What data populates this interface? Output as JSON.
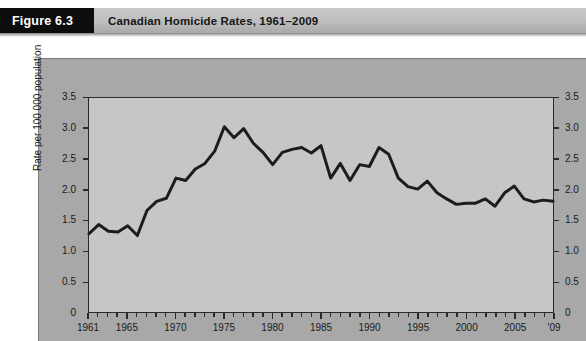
{
  "header": {
    "badge_label": "Figure 6.3",
    "title": "Canadian Homicide Rates, 1961–2009"
  },
  "colors": {
    "panel_background": "#a8a8a8",
    "plot_background": "#c6c6c6",
    "line_color": "#1c1c1c",
    "axis_color": "#2a2a2a",
    "badge_background": "#0d0d0d",
    "header_background": "#bdbdbd"
  },
  "chart_data": {
    "type": "line",
    "title": "Canadian Homicide Rates, 1961–2009",
    "xlabel": "",
    "ylabel": "Rate per 100 000 population",
    "ylabel_right": "Rate per 100 000 population",
    "xlim": [
      1961,
      2009
    ],
    "ylim": [
      0,
      3.5
    ],
    "grid": false,
    "legend": null,
    "y_ticks": [
      "0",
      "0.5",
      "1.0",
      "1.5",
      "2.0",
      "2.5",
      "3.0",
      "3.5"
    ],
    "y_tick_values": [
      0,
      0.5,
      1.0,
      1.5,
      2.0,
      2.5,
      3.0,
      3.5
    ],
    "y_ticks_right": [
      "0",
      "0.5",
      "1.0",
      "1.5",
      "2.0",
      "2.5",
      "3.0",
      "3.5"
    ],
    "x_ticks": [
      "1961",
      "1965",
      "1970",
      "1975",
      "1980",
      "1985",
      "1990",
      "1995",
      "2000",
      "2005",
      "'09"
    ],
    "x_tick_values": [
      1961,
      1965,
      1970,
      1975,
      1980,
      1985,
      1990,
      1995,
      2000,
      2005,
      2009
    ],
    "x_minor_tick_interval": 1,
    "series": [
      {
        "name": "Homicide rate",
        "x": [
          1961,
          1962,
          1963,
          1964,
          1965,
          1966,
          1967,
          1968,
          1969,
          1970,
          1971,
          1972,
          1973,
          1974,
          1975,
          1976,
          1977,
          1978,
          1979,
          1980,
          1981,
          1982,
          1983,
          1984,
          1985,
          1986,
          1987,
          1988,
          1989,
          1990,
          1991,
          1992,
          1993,
          1994,
          1995,
          1996,
          1997,
          1998,
          1999,
          2000,
          2001,
          2002,
          2003,
          2004,
          2005,
          2006,
          2007,
          2008,
          2009
        ],
        "values": [
          1.28,
          1.43,
          1.32,
          1.31,
          1.41,
          1.25,
          1.66,
          1.81,
          1.86,
          2.19,
          2.15,
          2.34,
          2.43,
          2.63,
          3.03,
          2.85,
          3.0,
          2.76,
          2.61,
          2.41,
          2.61,
          2.66,
          2.69,
          2.6,
          2.72,
          2.19,
          2.43,
          2.15,
          2.41,
          2.38,
          2.69,
          2.58,
          2.19,
          2.05,
          2.01,
          2.14,
          1.95,
          1.85,
          1.76,
          1.78,
          1.78,
          1.85,
          1.73,
          1.95,
          2.06,
          1.85,
          1.8,
          1.83,
          1.81
        ]
      }
    ]
  }
}
